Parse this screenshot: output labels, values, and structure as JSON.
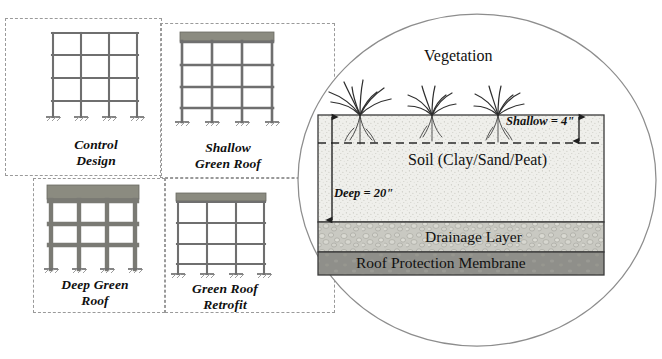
{
  "figure": {
    "type": "technical-diagram"
  },
  "archetypes": [
    {
      "id": "control-design",
      "caption_line1": "Control",
      "caption_line2": "Design",
      "stories": 4,
      "bays": 3,
      "columns": 4,
      "member_weight": "thin",
      "has_green_roof": false,
      "roof_slab_label": ""
    },
    {
      "id": "shallow-green-roof",
      "caption_line1": "Shallow",
      "caption_line2": "Green Roof",
      "stories": 4,
      "bays": 3,
      "columns": 4,
      "member_weight": "medium",
      "has_green_roof": true,
      "roof_slab_label": "green-roof-slab"
    },
    {
      "id": "deep-green-roof",
      "caption_line1": "Deep Green",
      "caption_line2": "Roof",
      "stories": 4,
      "bays": 3,
      "columns": 4,
      "member_weight": "thick",
      "has_green_roof": true,
      "roof_slab_label": "green-roof-slab"
    },
    {
      "id": "green-roof-retrofit",
      "caption_line1": "Green Roof",
      "caption_line2": "Retrofit",
      "stories": 4,
      "bays": 3,
      "columns": 4,
      "member_weight": "thin",
      "has_green_roof": true,
      "roof_slab_label": "green-roof-slab"
    }
  ],
  "detail_callout": {
    "shape": "ellipse",
    "layers": [
      {
        "id": "vegetation",
        "label": "Vegetation",
        "plants": 3
      },
      {
        "id": "soil",
        "label": "Soil (Clay/Sand/Peat)"
      },
      {
        "id": "drainage",
        "label": "Drainage Layer"
      },
      {
        "id": "membrane",
        "label": "Roof Protection Membrane"
      }
    ],
    "dimensions": [
      {
        "id": "shallow-depth",
        "label": "Shallow = 4\"",
        "value": 4,
        "unit": "in",
        "side": "right"
      },
      {
        "id": "deep-depth",
        "label": "Deep = 20\"",
        "value": 20,
        "unit": "in",
        "side": "left"
      }
    ]
  },
  "colors": {
    "green_roof_slab": "#8b8b80",
    "soil_fill": "#eeeeea",
    "drainage_fill": "#c9c9c2",
    "membrane_fill": "#8f8f8a",
    "frame_member": "#6f6f6f",
    "frame_member_thick": "#7a7a74",
    "outline": "#3a3a3a",
    "dashed_group": "#9a9a9a",
    "text": "#111111"
  }
}
